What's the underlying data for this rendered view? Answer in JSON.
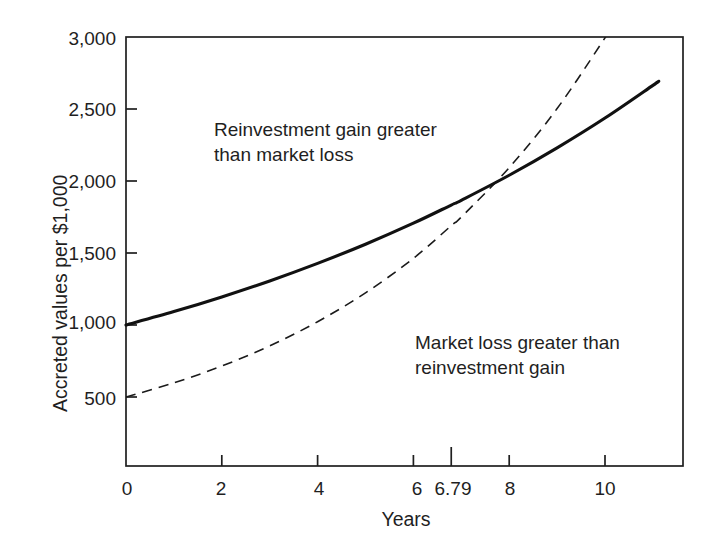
{
  "chart_data": {
    "type": "line",
    "title": "",
    "subtitle": "",
    "xlabel": "Years",
    "ylabel": "Accreted values per $1,000",
    "xlim": [
      0,
      11.6
    ],
    "ylim": [
      0,
      3000
    ],
    "grid": false,
    "legend_position": "none",
    "x_ticks": [
      {
        "value": 0,
        "label": "0"
      },
      {
        "value": 2,
        "label": "2"
      },
      {
        "value": 4,
        "label": "4"
      },
      {
        "value": 6,
        "label": "6"
      },
      {
        "value": 6.79,
        "label": "6.79"
      },
      {
        "value": 8,
        "label": "8"
      },
      {
        "value": 10,
        "label": "10"
      }
    ],
    "y_ticks": [
      {
        "value": 500,
        "label": "500"
      },
      {
        "value": 1000,
        "label": "1,000"
      },
      {
        "value": 1500,
        "label": "1,500"
      },
      {
        "value": 2000,
        "label": "2,000"
      },
      {
        "value": 2500,
        "label": "2,500"
      },
      {
        "value": 3000,
        "label": "3,000"
      }
    ],
    "series": [
      {
        "name": "Accreted value (reinvestment)",
        "style": "solid",
        "color": "#111111",
        "width": 3.1,
        "x": [
          0,
          1,
          2,
          3,
          4,
          5,
          6,
          6.79,
          7,
          8,
          9,
          10,
          11,
          11.12
        ],
        "values": [
          1000,
          1093,
          1195,
          1306,
          1428,
          1561,
          1707,
          1833,
          1866,
          2040,
          2230,
          2437,
          2664,
          2692
        ]
      },
      {
        "name": "Market value (bond price)",
        "style": "dashed",
        "color": "#1a1a1a",
        "width": 1.6,
        "x": [
          0,
          1,
          2,
          3,
          4,
          5,
          6,
          6.79,
          7,
          8,
          9,
          10,
          10.14
        ],
        "values": [
          500,
          598,
          715,
          855,
          1023,
          1223,
          1463,
          1690,
          1750,
          2093,
          2503,
          2994,
          3067
        ]
      }
    ],
    "crossover": {
      "x": 6.79,
      "y": 1690,
      "label": "6.79"
    },
    "annotations": [
      {
        "name": "reinvestment-gain-annotation",
        "lines": [
          "Reinvestment gain greater",
          "than market loss"
        ],
        "x_px": 214,
        "y_px": 117
      },
      {
        "name": "market-loss-annotation",
        "lines": [
          "Market loss greater than",
          "reinvestment gain"
        ],
        "x_px": 415,
        "y_px": 330
      }
    ],
    "plot_box_px": {
      "left": 126,
      "top": 37,
      "right": 683,
      "bottom": 466
    },
    "axis_color": "#1f1f1f"
  }
}
